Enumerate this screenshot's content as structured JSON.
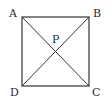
{
  "figure": {
    "type": "square-with-diagonals",
    "stroke_color": "#333333",
    "background": "#ffffff",
    "vertices": {
      "A": {
        "label": "A",
        "x": 22,
        "y": 17
      },
      "B": {
        "label": "B",
        "x": 89,
        "y": 17
      },
      "C": {
        "label": "C",
        "x": 89,
        "y": 86
      },
      "D": {
        "label": "D",
        "x": 22,
        "y": 86
      }
    },
    "intersection": {
      "label": "P",
      "x": 55.5,
      "y": 51.5
    },
    "segments": [
      "AB",
      "BC",
      "CD",
      "DA",
      "AC",
      "BD"
    ]
  }
}
